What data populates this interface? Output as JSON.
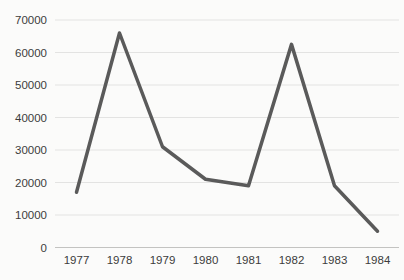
{
  "chart_data": {
    "type": "line",
    "title": "",
    "xlabel": "",
    "ylabel": "",
    "categories": [
      "1977",
      "1978",
      "1979",
      "1980",
      "1981",
      "1982",
      "1983",
      "1984"
    ],
    "series": [
      {
        "name": "series-1",
        "values": [
          17000,
          66000,
          31000,
          21000,
          19000,
          62500,
          19000,
          5000
        ]
      }
    ],
    "ylim": [
      0,
      70000
    ],
    "y_tick_step": 10000,
    "y_tick_labels": [
      "0",
      "10000",
      "20000",
      "30000",
      "40000",
      "50000",
      "60000",
      "70000"
    ],
    "grid": "horizontal",
    "legend": "none",
    "colors": {
      "line": "#5a5a5a",
      "gridline": "#e3e3e2",
      "axis_line": "#c3c3c1",
      "tick_text": "#3c3c3c",
      "background": "#fbfbfa"
    }
  }
}
